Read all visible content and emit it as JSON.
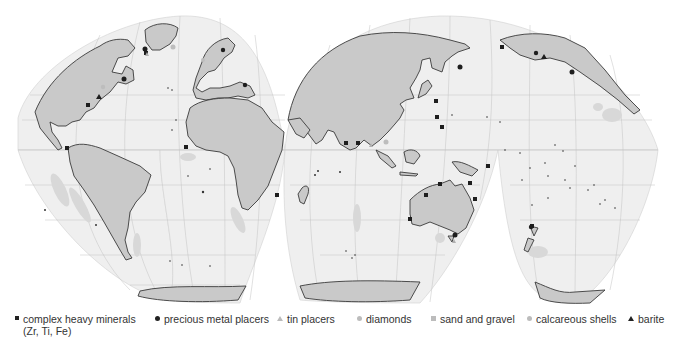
{
  "map": {
    "projection": "interrupted-homolosine",
    "colors": {
      "ocean": "#efefef",
      "land": "#c8c8c8",
      "coastline": "#3a3a3a",
      "graticule": "#bdbdbd",
      "deposit_zone": "#d7d7d7",
      "marker": "#1e1e1e"
    }
  },
  "legend": {
    "items": [
      {
        "symbol": "small-square",
        "label": "complex heavy minerals",
        "sub": "(Zr, Ti, Fe)"
      },
      {
        "symbol": "dot",
        "label": "precious metal placers"
      },
      {
        "symbol": "light-triangle",
        "label": "tin placers"
      },
      {
        "symbol": "light-dot",
        "label": "diamonds"
      },
      {
        "symbol": "light-square",
        "label": "sand and gravel"
      },
      {
        "symbol": "light-dot",
        "label": "calcareous shells"
      },
      {
        "symbol": "dark-triangle",
        "label": "barite"
      }
    ]
  }
}
